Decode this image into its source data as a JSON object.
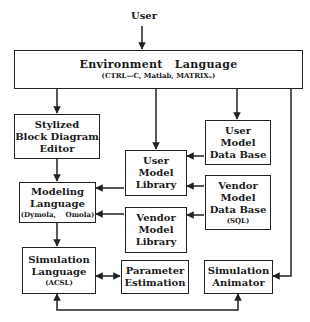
{
  "diagram": {
    "input_label": "User",
    "nodes": {
      "environment": {
        "title_words": [
          "Environment",
          "Language"
        ],
        "subtitle": "(CTRL—C,  Matlab,  MATRIXₓ)"
      },
      "stylized_editor": {
        "lines": [
          "Stylized",
          "Block Diagram",
          "Editor"
        ]
      },
      "user_model_library": {
        "lines": [
          "User",
          "Model",
          "Library"
        ]
      },
      "user_model_db": {
        "lines": [
          "User",
          "Model",
          "Data Base"
        ]
      },
      "vendor_model_db": {
        "lines": [
          "Vendor",
          "Model",
          "Data Base"
        ],
        "subtitle": "(SQL)"
      },
      "modeling_language": {
        "lines": [
          "Modeling",
          "Language"
        ],
        "subtitle": "(Dymola,    Omola)"
      },
      "vendor_model_library": {
        "lines": [
          "Vendor",
          "Model",
          "Library"
        ]
      },
      "simulation_language": {
        "lines": [
          "Simulation",
          "Language"
        ],
        "subtitle": "(ACSL)"
      },
      "parameter_estimation": {
        "lines": [
          "Parameter",
          "Estimation"
        ]
      },
      "simulation_animator": {
        "lines": [
          "Simulation",
          "Animator"
        ]
      }
    },
    "edges": [
      {
        "from": "User",
        "to": "environment"
      },
      {
        "from": "environment",
        "to": "stylized_editor"
      },
      {
        "from": "environment",
        "to": "user_model_library"
      },
      {
        "from": "environment",
        "to": "user_model_db"
      },
      {
        "from": "environment",
        "to": "simulation_animator"
      },
      {
        "from": "stylized_editor",
        "to": "modeling_language"
      },
      {
        "from": "user_model_db",
        "to": "user_model_library"
      },
      {
        "from": "vendor_model_db",
        "to": "user_model_library"
      },
      {
        "from": "vendor_model_db",
        "to": "vendor_model_library"
      },
      {
        "from": "user_model_library",
        "to": "modeling_language"
      },
      {
        "from": "vendor_model_library",
        "to": "modeling_language"
      },
      {
        "from": "modeling_language",
        "to": "simulation_language"
      },
      {
        "from": "simulation_language",
        "to": "parameter_estimation",
        "bidirectional": true
      },
      {
        "from": "simulation_language",
        "to": "simulation_animator",
        "bidirectional": true
      }
    ]
  }
}
